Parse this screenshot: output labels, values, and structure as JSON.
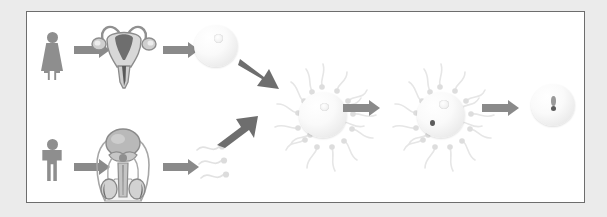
{
  "diagram": {
    "background_color": "#ebebeb",
    "panel_color": "#ffffff",
    "panel_border_color": "#6d6d6d",
    "arrow_color": "#8a8a8a",
    "arrow_color_dark": "#6e6e6e",
    "figure_color": "#8e8e8e",
    "cell_color": "#f4f4f4",
    "nucleus_spot_color": "#5c5c5c"
  },
  "female_pathway": {
    "label": "female pathway",
    "steps": [
      {
        "id": "female-figure",
        "label": "female human figure",
        "icon": "female-figure-icon"
      },
      {
        "id": "uterus",
        "label": "uterus with ovaries and fallopian tubes",
        "icon": "uterus-icon"
      },
      {
        "id": "ovum",
        "label": "ovum (egg cell)",
        "icon": "ovum-icon"
      }
    ],
    "arrows": [
      {
        "id": "female-to-uterus",
        "direction": "right"
      },
      {
        "id": "uterus-to-ovum",
        "direction": "right"
      },
      {
        "id": "ovum-to-fertilization",
        "direction": "down-right"
      }
    ]
  },
  "male_pathway": {
    "label": "male pathway",
    "steps": [
      {
        "id": "male-figure",
        "label": "male human figure",
        "icon": "male-figure-icon"
      },
      {
        "id": "male-reproductive-system",
        "label": "male reproductive system with testes",
        "icon": "male-anatomy-icon"
      },
      {
        "id": "sperm-cells",
        "label": "sperm cells",
        "icon": "sperm-icon",
        "count": 3
      }
    ],
    "arrows": [
      {
        "id": "male-to-anatomy",
        "direction": "right"
      },
      {
        "id": "anatomy-to-sperm",
        "direction": "right"
      },
      {
        "id": "sperm-to-fertilization",
        "direction": "up-right"
      }
    ]
  },
  "fertilization": {
    "label": "fertilization sequence",
    "stages": [
      {
        "id": "sperm-surrounding-ovum",
        "label": "many sperm surrounding the ovum",
        "sperm_count": 16,
        "penetrated": false
      },
      {
        "id": "sperm-penetrating-ovum",
        "label": "single sperm penetrating the ovum",
        "sperm_count": 16,
        "penetrated": true
      },
      {
        "id": "fertilized-zygote",
        "label": "fertilized egg (zygote)",
        "sperm_count": 0,
        "penetrated": true
      }
    ],
    "arrows": [
      {
        "id": "stage1-to-stage2",
        "direction": "right"
      },
      {
        "id": "stage2-to-zygote",
        "direction": "right"
      }
    ]
  }
}
